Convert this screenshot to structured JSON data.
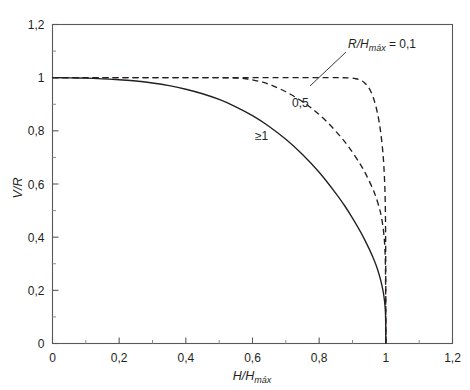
{
  "chart_data": {
    "type": "line",
    "title": "",
    "xlabel": "H/Hmáx",
    "ylabel": "V/R",
    "xlim": [
      0,
      1.2
    ],
    "ylim": [
      0,
      1.2
    ],
    "grid": false,
    "legend_position": "inline-annotations",
    "x_ticks": [
      "0",
      "0,2",
      "0,4",
      "0,6",
      "0,8",
      "1",
      "1,2"
    ],
    "x_tick_values": [
      0,
      0.2,
      0.4,
      0.6,
      0.8,
      1.0,
      1.2
    ],
    "y_ticks": [
      "0",
      "0,2",
      "0,4",
      "0,6",
      "0,8",
      "1",
      "1,2"
    ],
    "y_tick_values": [
      0,
      0.2,
      0.4,
      0.6,
      0.8,
      1.0,
      1.2
    ],
    "minor_tick_step": 0.1,
    "annotation": "R/Hmáx = 0,1",
    "annotation_prefix": "R/H",
    "annotation_subscript": "máx",
    "annotation_suffix": " = 0,1",
    "series": [
      {
        "name": "≥1",
        "label": "≥1",
        "style": "solid",
        "color": "#231f20",
        "points": [
          [
            0.0,
            1.0
          ],
          [
            0.05,
            0.9995
          ],
          [
            0.1,
            0.998
          ],
          [
            0.15,
            0.9955
          ],
          [
            0.2,
            0.992
          ],
          [
            0.25,
            0.9875
          ],
          [
            0.3,
            0.9798
          ],
          [
            0.35,
            0.9698
          ],
          [
            0.4,
            0.9565
          ],
          [
            0.45,
            0.9395
          ],
          [
            0.5,
            0.918
          ],
          [
            0.55,
            0.8905
          ],
          [
            0.6,
            0.857
          ],
          [
            0.65,
            0.8165
          ],
          [
            0.7,
            0.768
          ],
          [
            0.75,
            0.711
          ],
          [
            0.8,
            0.644
          ],
          [
            0.85,
            0.565
          ],
          [
            0.875,
            0.521
          ],
          [
            0.9,
            0.472
          ],
          [
            0.925,
            0.418
          ],
          [
            0.95,
            0.356
          ],
          [
            0.965,
            0.313
          ],
          [
            0.975,
            0.279
          ],
          [
            0.985,
            0.236
          ],
          [
            0.992,
            0.195
          ],
          [
            0.996,
            0.16
          ],
          [
            0.999,
            0.11
          ],
          [
            1.0,
            0.0
          ]
        ]
      },
      {
        "name": "0,5",
        "label": "0,5",
        "style": "dashed",
        "color": "#231f20",
        "points": [
          [
            0.0,
            1.0
          ],
          [
            0.1,
            1.0
          ],
          [
            0.2,
            1.0
          ],
          [
            0.3,
            1.0
          ],
          [
            0.4,
            1.0
          ],
          [
            0.5,
            1.0
          ],
          [
            0.55,
            0.9985
          ],
          [
            0.58,
            0.996
          ],
          [
            0.6,
            0.992
          ],
          [
            0.63,
            0.983
          ],
          [
            0.66,
            0.97
          ],
          [
            0.7,
            0.947
          ],
          [
            0.74,
            0.918
          ],
          [
            0.78,
            0.882
          ],
          [
            0.82,
            0.838
          ],
          [
            0.86,
            0.784
          ],
          [
            0.89,
            0.737
          ],
          [
            0.92,
            0.681
          ],
          [
            0.94,
            0.637
          ],
          [
            0.96,
            0.584
          ],
          [
            0.97,
            0.552
          ],
          [
            0.98,
            0.512
          ],
          [
            0.985,
            0.487
          ],
          [
            0.99,
            0.452
          ],
          [
            0.994,
            0.412
          ],
          [
            0.997,
            0.36
          ],
          [
            0.999,
            0.27
          ],
          [
            1.0,
            0.0
          ]
        ]
      },
      {
        "name": "0,1",
        "label": "0,1",
        "style": "dashed",
        "color": "#231f20",
        "points": [
          [
            0.0,
            1.0
          ],
          [
            0.2,
            1.0
          ],
          [
            0.4,
            1.0
          ],
          [
            0.6,
            1.0
          ],
          [
            0.75,
            1.0
          ],
          [
            0.85,
            1.0
          ],
          [
            0.89,
            0.999
          ],
          [
            0.91,
            0.996
          ],
          [
            0.925,
            0.99
          ],
          [
            0.935,
            0.982
          ],
          [
            0.945,
            0.969
          ],
          [
            0.955,
            0.948
          ],
          [
            0.962,
            0.926
          ],
          [
            0.97,
            0.893
          ],
          [
            0.976,
            0.86
          ],
          [
            0.981,
            0.825
          ],
          [
            0.985,
            0.79
          ],
          [
            0.989,
            0.747
          ],
          [
            0.992,
            0.705
          ],
          [
            0.994,
            0.668
          ],
          [
            0.996,
            0.62
          ],
          [
            0.9975,
            0.57
          ],
          [
            0.9985,
            0.51
          ],
          [
            0.9992,
            0.43
          ],
          [
            0.9997,
            0.3
          ],
          [
            1.0,
            0.0
          ]
        ]
      }
    ]
  },
  "labels": {
    "curve_ge1": "≥1",
    "curve_05": "0,5",
    "y_axis_title": "V/R",
    "x_axis_title_prefix": "H/H",
    "x_axis_title_sub": "máx"
  },
  "colors": {
    "line": "#231f20",
    "axis": "#58595b",
    "background": "#ffffff"
  }
}
